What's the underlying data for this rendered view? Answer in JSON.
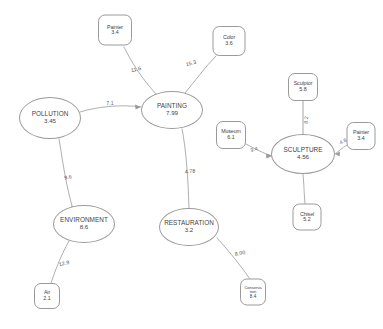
{
  "diagram": {
    "type": "semantic-network",
    "stroke_color": "#9a9a9a",
    "text_color": "#3f3f3f",
    "background_color": "#ffffff",
    "nodes": [
      {
        "id": "painter_top",
        "label": "Painter",
        "value": "3.4",
        "kind": "instance",
        "shape": "rounded-rect",
        "x": 115,
        "y": 30,
        "w": 34,
        "h": 31
      },
      {
        "id": "color",
        "label": "Color",
        "value": "3.6",
        "kind": "instance",
        "shape": "rounded-rect",
        "x": 229,
        "y": 41,
        "w": 33,
        "h": 30
      },
      {
        "id": "painting",
        "label": "PAINTING",
        "value": "7.99",
        "kind": "concept",
        "shape": "ellipse",
        "x": 172,
        "y": 110,
        "w": 62,
        "h": 38
      },
      {
        "id": "pollution",
        "label": "POLLUTION",
        "value": "3.45",
        "kind": "concept",
        "shape": "ellipse",
        "x": 50,
        "y": 118,
        "w": 62,
        "h": 42
      },
      {
        "id": "environment",
        "label": "ENVIRONMENT",
        "value": "8.6",
        "kind": "concept",
        "shape": "ellipse",
        "x": 84,
        "y": 224,
        "w": 62,
        "h": 38
      },
      {
        "id": "air",
        "label": "Air",
        "value": "2.1",
        "kind": "instance",
        "shape": "rounded-rect",
        "x": 47,
        "y": 296,
        "w": 26,
        "h": 26
      },
      {
        "id": "restauration",
        "label": "RESTAURATION",
        "value": "3.2",
        "kind": "concept",
        "shape": "ellipse",
        "x": 189,
        "y": 227,
        "w": 60,
        "h": 38
      },
      {
        "id": "conservation",
        "label": "Conserva\ntion",
        "value": "8.4",
        "kind": "instance",
        "shape": "rounded-rect",
        "x": 253,
        "y": 292,
        "w": 26,
        "h": 27
      },
      {
        "id": "sculptor",
        "label": "Sculptor",
        "value": "5.8",
        "kind": "instance",
        "shape": "rounded-rect",
        "x": 303,
        "y": 87,
        "w": 30,
        "h": 28
      },
      {
        "id": "museum",
        "label": "Museum",
        "value": "6.1",
        "kind": "instance",
        "shape": "rounded-rect",
        "x": 231,
        "y": 135,
        "w": 30,
        "h": 28
      },
      {
        "id": "sculpture",
        "label": "SCULPTURE",
        "value": "4.56",
        "kind": "concept",
        "shape": "ellipse",
        "x": 303,
        "y": 154,
        "w": 64,
        "h": 40
      },
      {
        "id": "painter_right",
        "label": "Painter",
        "value": "3.4",
        "kind": "instance",
        "shape": "rounded-rect",
        "x": 361,
        "y": 136,
        "w": 29,
        "h": 28
      },
      {
        "id": "chisel",
        "label": "Chisel",
        "value": "5.2",
        "kind": "instance",
        "shape": "rounded-rect",
        "x": 307,
        "y": 217,
        "w": 29,
        "h": 27
      }
    ],
    "edges": [
      {
        "from": "painter_top",
        "to": "painting",
        "label": "11.6"
      },
      {
        "from": "color",
        "to": "painting",
        "label": "15.3"
      },
      {
        "from": "pollution",
        "to": "painting",
        "label": "7.1"
      },
      {
        "from": "pollution",
        "to": "environment",
        "label": "9.6"
      },
      {
        "from": "environment",
        "to": "air",
        "label": "12.9"
      },
      {
        "from": "painting",
        "to": "restauration",
        "label": "4.78"
      },
      {
        "from": "restauration",
        "to": "conservation",
        "label": "8.00"
      },
      {
        "from": "sculptor",
        "to": "sculpture",
        "label": "8.2"
      },
      {
        "from": "museum",
        "to": "sculpture",
        "label": "9.4"
      },
      {
        "from": "painter_right",
        "to": "sculpture",
        "label": "4.8"
      },
      {
        "from": "chisel",
        "to": "sculpture",
        "label": ""
      }
    ],
    "edge_label_positions": [
      {
        "id": "lbl-painter-top",
        "text": "11.6",
        "x": 136,
        "y": 69,
        "rotate": -12
      },
      {
        "id": "lbl-color",
        "text": "15.3",
        "x": 191,
        "y": 63,
        "rotate": -16
      },
      {
        "id": "lbl-pollution",
        "text": "7.1",
        "x": 110,
        "y": 103,
        "rotate": 0
      },
      {
        "id": "lbl-environment",
        "text": "9.6",
        "x": 68,
        "y": 177,
        "rotate": -8
      },
      {
        "id": "lbl-air",
        "text": "12.9",
        "x": 64,
        "y": 263,
        "rotate": -14
      },
      {
        "id": "lbl-restauration",
        "text": "4.78",
        "x": 190,
        "y": 171,
        "rotate": -5
      },
      {
        "id": "lbl-conservation",
        "text": "8.00",
        "x": 240,
        "y": 253,
        "rotate": -12
      },
      {
        "id": "lbl-sculptor",
        "text": "8.2",
        "x": 306,
        "y": 120,
        "rotate": -88
      },
      {
        "id": "lbl-museum",
        "text": "9.4",
        "x": 254,
        "y": 149,
        "rotate": -16
      },
      {
        "id": "lbl-painter-right",
        "text": "4.8",
        "x": 343,
        "y": 141,
        "rotate": -26
      }
    ]
  }
}
